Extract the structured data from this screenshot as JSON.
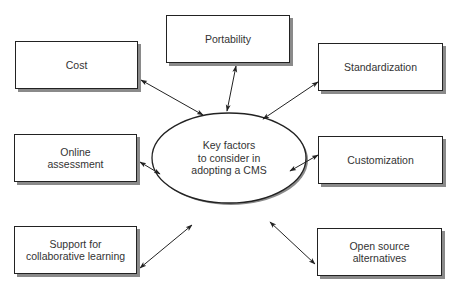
{
  "diagram": {
    "center": {
      "lines": [
        "Key factors",
        "to consider in",
        "adopting a CMS"
      ]
    },
    "nodes": [
      {
        "id": "cost",
        "lines": [
          "Cost"
        ]
      },
      {
        "id": "portability",
        "lines": [
          "Portability"
        ]
      },
      {
        "id": "standardization",
        "lines": [
          "Standardization"
        ]
      },
      {
        "id": "online-assessment",
        "lines": [
          "Online",
          "assessment"
        ]
      },
      {
        "id": "customization",
        "lines": [
          "Customization"
        ]
      },
      {
        "id": "collaborative-learning",
        "lines": [
          "Support for",
          "collaborative learning"
        ]
      },
      {
        "id": "open-source",
        "lines": [
          "Open source",
          "alternatives"
        ]
      }
    ],
    "edges": [
      {
        "from": "center",
        "to": "cost",
        "type": "bidirectional-arrow"
      },
      {
        "from": "center",
        "to": "portability",
        "type": "bidirectional-arrow"
      },
      {
        "from": "center",
        "to": "standardization",
        "type": "bidirectional-arrow"
      },
      {
        "from": "center",
        "to": "online-assessment",
        "type": "bidirectional-arrow"
      },
      {
        "from": "center",
        "to": "customization",
        "type": "bidirectional-arrow"
      },
      {
        "from": "center",
        "to": "collaborative-learning",
        "type": "bidirectional-arrow"
      },
      {
        "from": "center",
        "to": "open-source",
        "type": "bidirectional-arrow"
      }
    ],
    "colors": {
      "stroke": "#222222",
      "shadow": "#8a8a8a",
      "text": "#333333",
      "background": "#ffffff"
    }
  }
}
